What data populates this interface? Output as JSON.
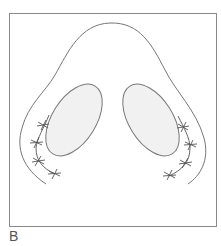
{
  "figure": {
    "panel_label": "B",
    "colors": {
      "frame": "#8a8a8a",
      "outline": "#777777",
      "hatch": "#d9d9d9",
      "suture": "#555555",
      "label": "#555555"
    },
    "elements": [
      {
        "name": "outer-contour",
        "description": "nose outline"
      },
      {
        "name": "left-nostril",
        "description": "hatched oval nostril (left)"
      },
      {
        "name": "right-nostril",
        "description": "hatched oval nostril (right)"
      },
      {
        "name": "left-suture-line",
        "stitches": 4
      },
      {
        "name": "right-suture-line",
        "stitches": 4
      }
    ]
  }
}
